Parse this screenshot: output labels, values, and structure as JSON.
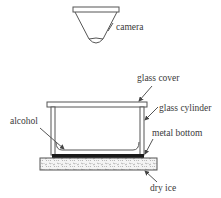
{
  "diagram": {
    "labels": {
      "camera": "camera",
      "glass_cover": "glass cover",
      "glass_cylinder": "glass cylinder",
      "alcohol": "alcohol",
      "metal_bottom": "metal bottom",
      "dry_ice": "dry ice"
    },
    "colors": {
      "line": "#555555",
      "text": "#3a3a3a",
      "metal": "#1a1a1a",
      "background": "#ffffff"
    }
  }
}
